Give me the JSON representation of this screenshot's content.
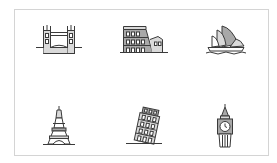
{
  "illustration": {
    "title": "",
    "colors": {
      "stroke": "#3a3a3a",
      "fill_light": "#d9d9d9",
      "fill_mid": "#a8a8a8",
      "fill_dark": "#6e6e6e",
      "frame_border": "#d4d4d4",
      "background": "#ffffff"
    },
    "icons": [
      {
        "name": "tower-bridge",
        "row": 1,
        "col": 1
      },
      {
        "name": "colosseum",
        "row": 1,
        "col": 2
      },
      {
        "name": "sydney-opera-house",
        "row": 1,
        "col": 3
      },
      {
        "name": "eiffel-tower",
        "row": 2,
        "col": 1
      },
      {
        "name": "leaning-tower-of-pisa",
        "row": 2,
        "col": 2
      },
      {
        "name": "big-ben",
        "row": 2,
        "col": 3
      }
    ]
  }
}
